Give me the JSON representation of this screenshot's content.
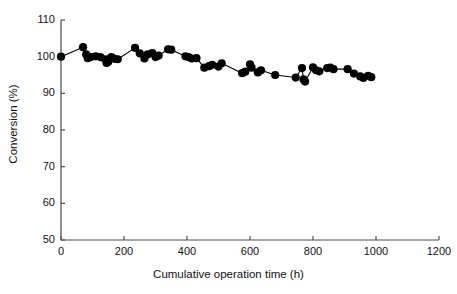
{
  "chart_data": {
    "type": "scatter",
    "title": "",
    "xlabel": "Cumulative operation time (h)",
    "ylabel": "Conversion (%)",
    "xlim": [
      0,
      1200
    ],
    "ylim": [
      50,
      110
    ],
    "xticks": [
      0,
      200,
      400,
      600,
      800,
      1000,
      1200
    ],
    "yticks": [
      50,
      60,
      70,
      80,
      90,
      100,
      110
    ],
    "xtick_labels": [
      "0",
      "200",
      "400",
      "600",
      "800",
      "1000",
      "1200"
    ],
    "ytick_labels": [
      "50",
      "60",
      "70",
      "80",
      "90",
      "100",
      "110"
    ],
    "grid": false,
    "legend": null,
    "marker": "filled-circle",
    "marker_color": "#000000",
    "line_color": "#000000",
    "series": [
      {
        "name": "Conversion",
        "x": [
          0,
          70,
          80,
          85,
          95,
          110,
          125,
          140,
          145,
          150,
          155,
          160,
          170,
          180,
          235,
          250,
          265,
          275,
          290,
          300,
          310,
          340,
          350,
          395,
          405,
          415,
          430,
          455,
          470,
          480,
          500,
          510,
          575,
          585,
          600,
          605,
          625,
          635,
          680,
          745,
          765,
          770,
          775,
          800,
          810,
          820,
          845,
          855,
          865,
          910,
          930,
          950,
          960,
          975,
          985
        ],
        "y": [
          100.0,
          102.6,
          100.6,
          99.6,
          99.9,
          100.1,
          99.9,
          99.3,
          98.3,
          98.6,
          99.4,
          99.9,
          99.4,
          99.3,
          102.4,
          100.9,
          99.5,
          100.6,
          101.0,
          99.9,
          100.3,
          102.0,
          101.9,
          100.1,
          99.9,
          99.5,
          99.6,
          97.0,
          97.4,
          97.8,
          97.3,
          98.2,
          95.5,
          95.9,
          97.9,
          97.0,
          95.7,
          96.3,
          95.0,
          94.3,
          96.9,
          93.8,
          93.2,
          97.1,
          96.3,
          96.0,
          96.9,
          97.0,
          96.6,
          96.6,
          95.4,
          94.6,
          94.2,
          94.8,
          94.4
        ]
      }
    ]
  },
  "axis": {
    "color": "#4d4d4d",
    "width": 1.2
  }
}
